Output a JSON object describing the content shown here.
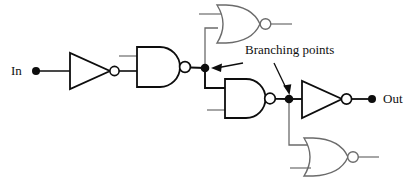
{
  "diagram": {
    "type": "digital-logic-schematic",
    "colors": {
      "wire_primary": "#0d0d0d",
      "wire_secondary": "#5a5a5a",
      "gate_outline_primary": "#0d0d0d",
      "gate_outline_secondary": "#6b6b6b",
      "text": "#111111",
      "background": "#ffffff"
    }
  },
  "labels": {
    "input": "In",
    "output": "Out",
    "branching": "Branching points"
  },
  "terminals": [
    {
      "name": "input-terminal",
      "label": "In",
      "x": 36,
      "y": 71
    },
    {
      "name": "output-terminal",
      "label": "Out",
      "x": 372,
      "y": 99
    }
  ],
  "branch_points": [
    {
      "name": "branching-point-1",
      "x": 205,
      "y": 68
    },
    {
      "name": "branching-point-2",
      "x": 289,
      "y": 99
    }
  ],
  "gates": [
    {
      "id": "inverter-1",
      "type": "NOT",
      "label": "inverter",
      "inputs": 1,
      "x": 70,
      "y": 71,
      "driven_by": "In"
    },
    {
      "id": "nand-1",
      "type": "NAND",
      "label": "nand-gate",
      "inputs": 2,
      "x": 137,
      "y": 66,
      "driven_by": "inverter-1"
    },
    {
      "id": "nor-top",
      "type": "NOR",
      "label": "nor-gate",
      "inputs": 2,
      "x": 218,
      "y": 24,
      "driven_by": "branching-point-1"
    },
    {
      "id": "nand-2",
      "type": "NAND",
      "label": "nand-gate",
      "inputs": 2,
      "x": 225,
      "y": 98,
      "driven_by": "branching-point-1"
    },
    {
      "id": "inverter-2",
      "type": "NOT",
      "label": "inverter",
      "inputs": 1,
      "x": 302,
      "y": 99,
      "driven_by": "branching-point-2"
    },
    {
      "id": "nor-bottom",
      "type": "NOR",
      "label": "nor-gate",
      "inputs": 2,
      "x": 305,
      "y": 157,
      "driven_by": "branching-point-2"
    }
  ],
  "annotations": [
    {
      "name": "branching-callout",
      "text": "Branching points",
      "arrow_targets": [
        "branching-point-1",
        "branching-point-2"
      ]
    }
  ]
}
